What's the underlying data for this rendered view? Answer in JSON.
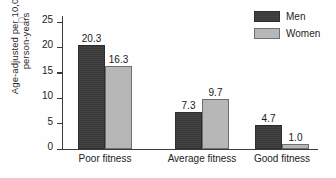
{
  "chart_data": {
    "type": "bar",
    "title": "",
    "xlabel": "",
    "ylabel": "Age-adjusted per 10,000 person-years",
    "ylabel_line1": "Age-adjusted per 10,000",
    "ylabel_line2": "person-years",
    "categories": [
      "Poor fitness",
      "Average fitness",
      "Good fitness"
    ],
    "series": [
      {
        "name": "Men",
        "color": "#393939",
        "values": [
          20.3,
          7.3,
          4.7
        ]
      },
      {
        "name": "Women",
        "color": "#b4b4b4",
        "values": [
          16.3,
          9.7,
          1.0
        ]
      }
    ],
    "value_labels": {
      "men": [
        "20.3",
        "7.3",
        "4.7"
      ],
      "women": [
        "16.3",
        "9.7",
        "1.0"
      ]
    },
    "ylim": [
      0,
      25
    ],
    "yticks": [
      0,
      5,
      10,
      15,
      20,
      25
    ],
    "ytick_labels": [
      "0",
      "5",
      "10",
      "15",
      "20",
      "25"
    ],
    "grid": false,
    "legend_position": "top-right"
  },
  "legend": {
    "items": [
      {
        "label": "Men",
        "swatch": "men"
      },
      {
        "label": "Women",
        "swatch": "women"
      }
    ]
  }
}
